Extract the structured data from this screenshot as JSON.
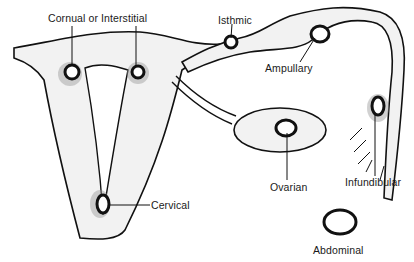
{
  "figure": {
    "colors": {
      "ink": "#111111",
      "background": "#ffffff",
      "stipple": "#f2f2f2"
    }
  },
  "labels": {
    "cornual": "Cornual or Interstitial",
    "isthmic": "Isthmic",
    "ampullary": "Ampullary",
    "ovarian": "Ovarian",
    "infundibular": "Infundibular",
    "cervical": "Cervical",
    "abdominal": "Abdominal"
  }
}
